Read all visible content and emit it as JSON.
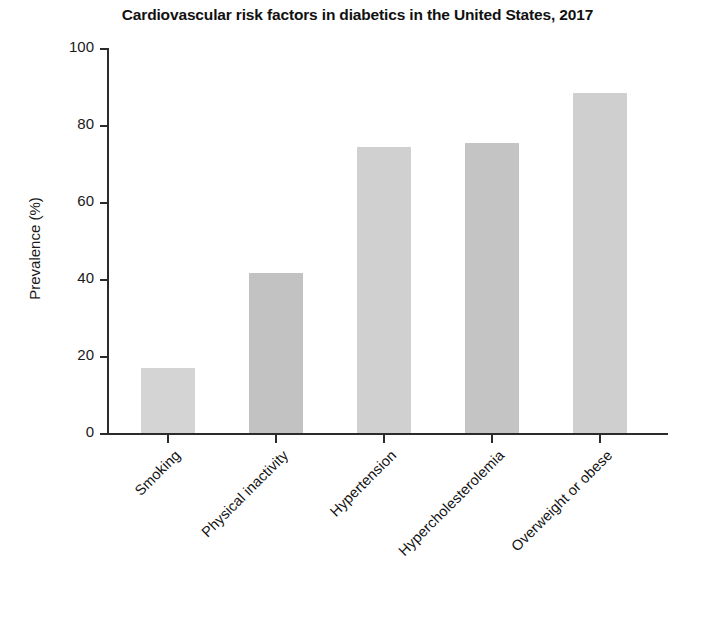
{
  "chart_data": {
    "type": "bar",
    "title": "Cardiovascular risk factors in diabetics in the United States, 2017",
    "xlabel": "",
    "ylabel": "Prevalence (%)",
    "ylim": [
      0,
      100
    ],
    "ytick_labels": [
      "0",
      "20",
      "40",
      "60",
      "80",
      "100"
    ],
    "ytick_values": [
      0,
      20,
      40,
      60,
      80,
      100
    ],
    "grid": false,
    "legend": false,
    "categories": [
      "Smoking",
      "Physical inactivity",
      "Hypertension",
      "Hypercholesterolemia",
      "Overweight or obese"
    ],
    "values": [
      17,
      41.5,
      74.2,
      75.3,
      88.2
    ],
    "bar_colors": [
      "#d4d4d4",
      "#c2c2c2",
      "#d0d0d0",
      "#c4c4c4",
      "#cfcfcf"
    ],
    "axis_color": "#2b2b2b",
    "background": "#ffffff",
    "tick_label_rotation": -45
  }
}
